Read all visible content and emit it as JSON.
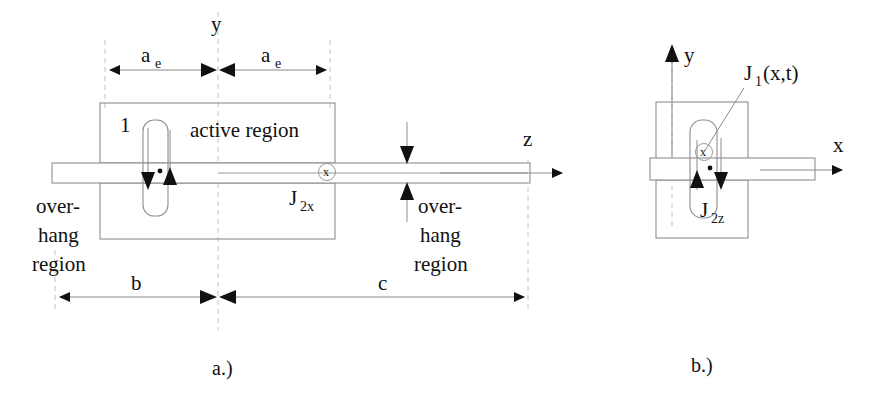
{
  "figure": {
    "caption_a": "a.)",
    "caption_b": "b.)",
    "panel_a": {
      "axis_z_label": "z",
      "axis_y_label": "y",
      "dim_ae_left_label": "a",
      "dim_ae_left_sub": "e",
      "dim_ae_right_label": "a",
      "dim_ae_right_sub": "e",
      "dim_b_label": "b",
      "dim_c_label": "c",
      "active_region_label": "active region",
      "contact_label": "1",
      "overhang_left_line1": "over-",
      "overhang_left_line2": "hang",
      "overhang_left_line3": "region",
      "overhang_right_line1": "over-",
      "overhang_right_line2": "hang",
      "overhang_right_line3": "region",
      "current_j2x_label": "J",
      "current_j2x_sub": "2x",
      "axis_into_page_label": "x"
    },
    "panel_b": {
      "axis_y_label": "y",
      "axis_x_label": "x",
      "current_j1_label": "J",
      "current_j1_sub": "1",
      "current_j1_args": "(x,t)",
      "current_j2z_label": "J",
      "current_j2z_sub": "2z",
      "axis_into_page_label": "x"
    },
    "colors": {
      "ink": "#111111",
      "structure_line": "#8e8e8e",
      "thin_line": "#9a9a9a",
      "dashed_guide": "#c2c2c2",
      "background": "#ffffff"
    }
  }
}
